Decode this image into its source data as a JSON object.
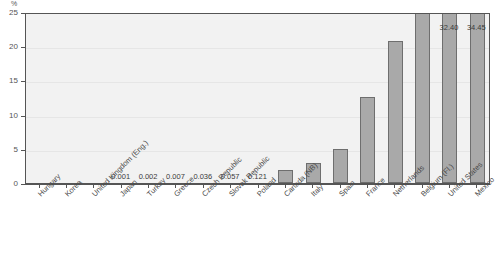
{
  "chart_data": {
    "type": "bar",
    "title": "",
    "subtitle": "",
    "xlabel": "",
    "ylabel": "%",
    "ylim": [
      0,
      25
    ],
    "yticks": [
      0,
      5,
      10,
      15,
      20,
      25
    ],
    "grid": true,
    "legend": false,
    "legend_position": "none",
    "axis_unit": "%",
    "note": "Bars for Belgium (Fl.), United States and Mexico exceed the 25% axis maximum and are clipped at the top of the plot; their values are printed above the axis.",
    "categories": [
      "Hungary",
      "Korea",
      "United Kingdom (Eng.)",
      "Japan",
      "Turkey",
      "Greece",
      "Czech Republic",
      "Slovak Republic",
      "Poland",
      "Canada (NB)",
      "Italy",
      "Spain",
      "France",
      "Netherlands",
      "Belgium (Fl.)",
      "United States",
      "Mexico"
    ],
    "values": [
      0,
      0,
      0,
      0.001,
      0.002,
      0.007,
      0.036,
      0.057,
      0.121,
      1.9,
      2.9,
      4.9,
      12.6,
      20.7,
      27.0,
      32.4,
      34.45
    ],
    "point_labels": [
      "",
      "",
      "",
      "0.001",
      "0.002",
      "0.007",
      "0.036",
      "0.057",
      "0.121",
      "",
      "",
      "",
      "",
      "",
      "",
      "32.40",
      "34.45"
    ],
    "bar_color": "#a9a9a9",
    "bar_edge_color": "#6e6e6e",
    "plot_background": "#f2f2f2",
    "axis_color": "#555555"
  }
}
